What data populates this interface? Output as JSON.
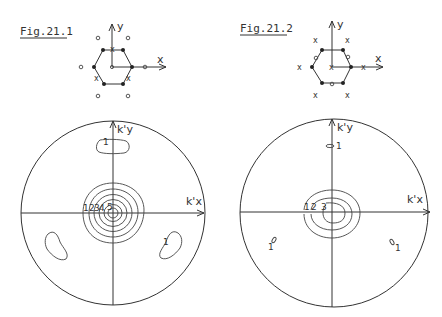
{
  "figures": [
    {
      "id": "fig1",
      "title": "Fig.21.1",
      "lattice": {
        "axis_x_label": "x",
        "axis_y_label": "y",
        "outer_site_marker": "o",
        "bond_marker": "x",
        "vertex_marker": "filled-dot"
      },
      "contour_plot": {
        "axis_x_label": "k'x",
        "axis_y_label": "k'y",
        "central_contour_labels": [
          "1",
          "2",
          "3",
          "4",
          "5"
        ],
        "island_label": "1"
      }
    },
    {
      "id": "fig2",
      "title": "Fig.21.2",
      "lattice": {
        "axis_x_label": "x",
        "axis_y_label": "y",
        "outer_site_marker": "x",
        "bond_marker": "o",
        "vertex_marker": "filled-dot"
      },
      "contour_plot": {
        "axis_x_label": "k'x",
        "axis_y_label": "k'y",
        "central_contour_labels": [
          "1",
          "2",
          "3"
        ],
        "island_label": "1"
      }
    }
  ],
  "colors": {
    "ink": "#333333",
    "background": "#ffffff"
  }
}
